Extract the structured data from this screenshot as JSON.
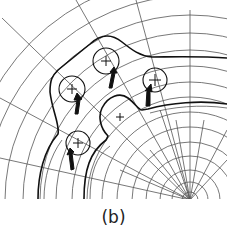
{
  "figure": {
    "caption": "(b)",
    "polar_center": [
      190,
      200
    ],
    "grid_radii": [
      8,
      18,
      30,
      44,
      58,
      73,
      88,
      103,
      118,
      134,
      150,
      167,
      185,
      204,
      224
    ],
    "radial_angles_deg": [
      90,
      100,
      112,
      125,
      140,
      157,
      170,
      80,
      68,
      55
    ],
    "locators": [
      {
        "id": "locator-1",
        "cx": 72,
        "cy": 89,
        "r": 13
      },
      {
        "id": "locator-2",
        "cx": 106,
        "cy": 61,
        "r": 13
      },
      {
        "id": "locator-3",
        "cx": 155,
        "cy": 80,
        "r": 12
      },
      {
        "id": "locator-4",
        "cx": 78,
        "cy": 143,
        "r": 12
      }
    ],
    "center_mark": [
      120,
      117
    ],
    "colors": {
      "line": "#111111",
      "grid": "#555555",
      "background": "#ffffff"
    }
  }
}
